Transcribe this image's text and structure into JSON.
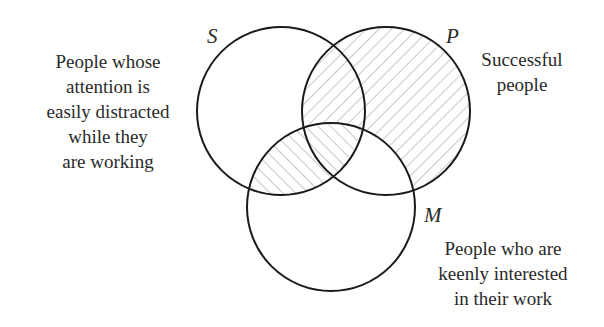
{
  "diagram": {
    "type": "venn",
    "sets": [
      {
        "id": "S",
        "name": "S",
        "description_lines": [
          "People whose",
          "attention is",
          "easily distracted",
          "while they",
          "are working"
        ]
      },
      {
        "id": "P",
        "name": "P",
        "description_lines": [
          "Successful",
          "people"
        ]
      },
      {
        "id": "M",
        "name": "M",
        "description_lines": [
          "People who are",
          "keenly interested",
          "in their work"
        ]
      }
    ],
    "shaded_regions": [
      {
        "region": "P not M",
        "hatch": "forward-slash"
      },
      {
        "region": "S and M",
        "hatch": "back-slash"
      }
    ],
    "colors": {
      "stroke": "#1a1a1a",
      "hatch": "#9a9a9a",
      "text": "#2a2a2a",
      "background": "#ffffff"
    }
  }
}
